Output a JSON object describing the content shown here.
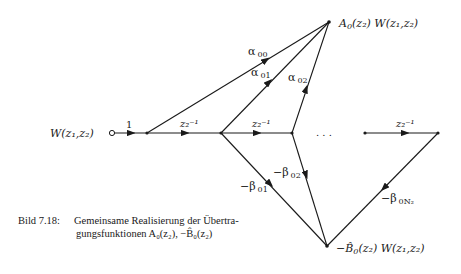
{
  "diagram": {
    "type": "signal-flow-graph",
    "input": {
      "label": "W(z₁,z₂)"
    },
    "output_top": {
      "label_main": "A",
      "label_sub": "0",
      "label_rest": "(z₂) W(z₁,z₂)"
    },
    "output_bottom": {
      "label_main": "−B̂",
      "label_sub": "0",
      "label_rest": "(z₂) W(z₁,z₂)"
    },
    "branches": {
      "input_gain": "1",
      "delay_1": "z₂⁻¹",
      "delay_2": "z₂⁻¹",
      "delay_last": "z₂⁻¹",
      "alpha_00": {
        "sym": "α",
        "sub": "00"
      },
      "alpha_01": {
        "sym": "α",
        "sub": "01"
      },
      "alpha_02": {
        "sym": "α",
        "sub": "02"
      },
      "beta_01": {
        "sym": "−β",
        "sub": "01"
      },
      "beta_02": {
        "sym": "−β",
        "sub": "02"
      },
      "beta_0N2": {
        "sym": "−β",
        "sub": "0N₂"
      }
    },
    "ellipsis": ". . ."
  },
  "caption": {
    "label": "Bild 7.18:",
    "line1": "Gemeinsame Realisierung der Übertra-",
    "line2": "gungsfunktionen A₀(z₂), −B̂₀(z₂)"
  }
}
